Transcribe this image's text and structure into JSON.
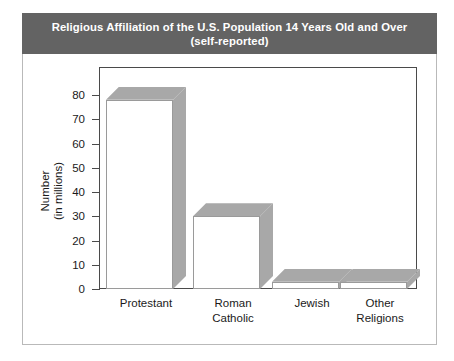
{
  "chart_data": {
    "type": "bar",
    "title": "Religious Affiliation of the U.S. Population 14 Years Old and Over",
    "subtitle": "(self-reported)",
    "title_line1": "Religious Affiliation of the U.S. Population 14 Years Old and Over",
    "title_line2": "(self-reported)",
    "xlabel": "",
    "ylabel": "Number",
    "ylabel_line1": "Number",
    "ylabel_line2": "(in millions)",
    "categories": [
      "Protestant",
      "Roman Catholic",
      "Jewish",
      "Other Religions"
    ],
    "category_lines": [
      [
        "Protestant"
      ],
      [
        "Roman",
        "Catholic"
      ],
      [
        "Jewish"
      ],
      [
        "Other",
        "Religions"
      ]
    ],
    "values": [
      78,
      30,
      3,
      3
    ],
    "ylim": [
      0,
      80
    ],
    "ytick_values": [
      0,
      10,
      20,
      30,
      40,
      50,
      60,
      70,
      80
    ],
    "ytick_labels": [
      "0",
      "10",
      "20",
      "30",
      "40",
      "50",
      "60",
      "70",
      "80"
    ],
    "grid": false,
    "legend": false,
    "style": "3d-block",
    "colors": {
      "title_bar_bg": "#636363",
      "title_text": "#ffffff",
      "bar_face": "#ffffff",
      "bar_shade": "#a8a8a8",
      "bar_outline": "#9a9a9a",
      "axis": "#4a4a4a",
      "frame_border": "#b9b9b9",
      "text": "#1a1a1a",
      "background": "#ffffff"
    }
  }
}
